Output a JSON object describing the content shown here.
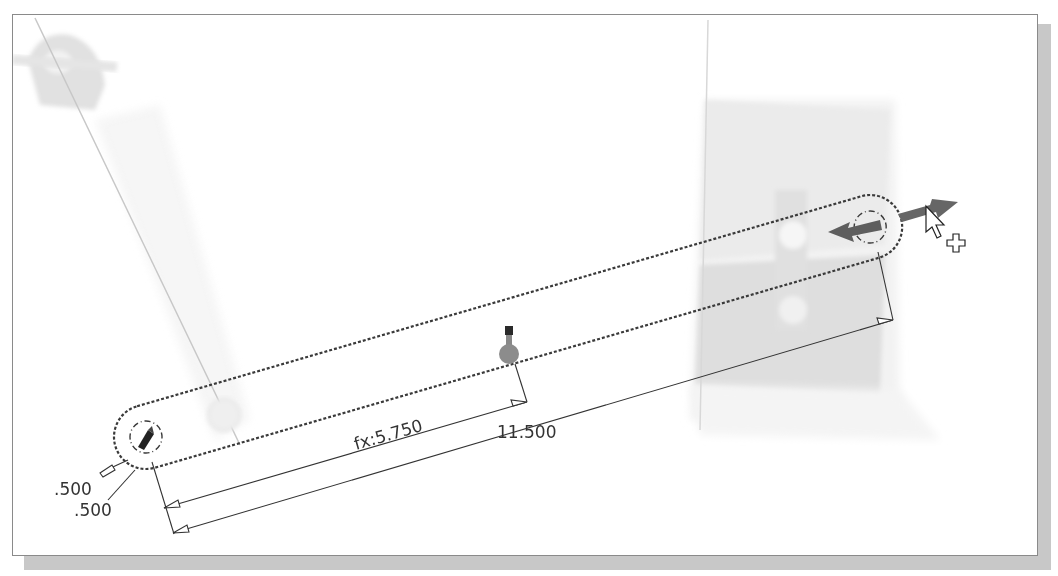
{
  "canvas": {
    "background": "#ffffff",
    "border_color": "#8a8a8a",
    "shadow_color": "#c8c8c8"
  },
  "sketch": {
    "slot_line_color": "#3a3a3a",
    "ghost_color": "#d6d6d6",
    "grip_color": "#666666"
  },
  "dimensions": {
    "hole_diameter_1": ".500",
    "hole_diameter_2": ".500",
    "midpoint_driven": "fx:5.750",
    "overall_length": "11.500"
  },
  "icons": {
    "move_cursor": "arrow-cursor-with-plus",
    "drag_handle": "double-arrow-drag-grip",
    "midpoint_marker": "midpoint-pin"
  }
}
